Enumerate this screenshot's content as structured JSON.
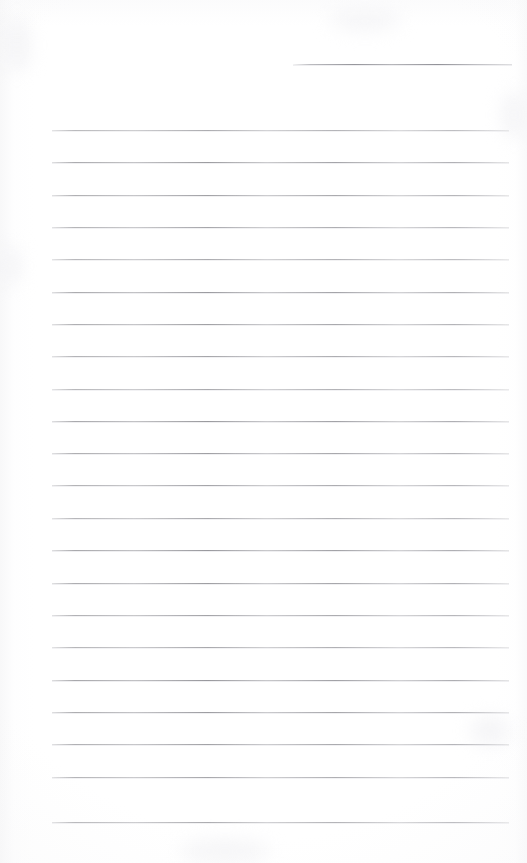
{
  "document": {
    "kind": "scanned-page",
    "title": "Blank ruled notepad page",
    "page_width": 527,
    "page_height": 863,
    "background_color": "#ffffff",
    "rule_color": "#a8a8ad",
    "has_text_content": false,
    "has_handwriting": false,
    "has_margin_line": false,
    "visible_text": ""
  },
  "header_rule": {
    "name": "header-rule",
    "x": 293,
    "y": 64,
    "width": 219,
    "description": "short horizontal rule in upper right area"
  },
  "body_rules": {
    "name": "body-ruled-lines",
    "count": 22,
    "left": 52,
    "right": 509,
    "width": 457,
    "first_y": 130,
    "spacing": 32.3,
    "y_positions": [
      130,
      162,
      195,
      227,
      259,
      292,
      324,
      356,
      389,
      421,
      453,
      485,
      518,
      550,
      583,
      615,
      647,
      680,
      712,
      744,
      777,
      822
    ]
  },
  "texture": {
    "blotches": [
      {
        "x": 4,
        "y": 18,
        "w": 26,
        "h": 54
      },
      {
        "x": 0,
        "y": 246,
        "w": 20,
        "h": 40
      },
      {
        "x": 502,
        "y": 92,
        "w": 24,
        "h": 46
      },
      {
        "x": 470,
        "y": 716,
        "w": 40,
        "h": 30
      },
      {
        "x": 180,
        "y": 840,
        "w": 90,
        "h": 22
      },
      {
        "x": 330,
        "y": 12,
        "w": 70,
        "h": 18
      }
    ]
  }
}
